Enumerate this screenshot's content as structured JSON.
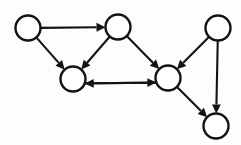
{
  "diagram": {
    "type": "directed-graph",
    "canvas": {
      "width": 241,
      "height": 145,
      "background": "#fdfdfd"
    },
    "style": {
      "node_fill": "#ffffff",
      "node_stroke": "#131313",
      "node_stroke_width": 2.4,
      "node_radius": 12.5,
      "edge_color": "#131313",
      "edge_width": 2.1,
      "arrowhead_length": 9,
      "arrowhead_halfwidth": 4.4
    },
    "node_count": 6,
    "edge_count": 9,
    "nodes": [
      {
        "id": "n1",
        "label": "",
        "name": "node-top-left",
        "cx": 28,
        "cy": 28,
        "r": 12.5
      },
      {
        "id": "n2",
        "label": "",
        "name": "node-top-middle",
        "cx": 118,
        "cy": 27,
        "r": 12.5
      },
      {
        "id": "n3",
        "label": "",
        "name": "node-top-right",
        "cx": 218,
        "cy": 28,
        "r": 12.5
      },
      {
        "id": "n4",
        "label": "",
        "name": "node-left-middle",
        "cx": 73,
        "cy": 79,
        "r": 12.5
      },
      {
        "id": "n5",
        "label": "",
        "name": "node-right-middle",
        "cx": 168,
        "cy": 78,
        "r": 12.5
      },
      {
        "id": "n6",
        "label": "",
        "name": "node-bottom-right",
        "cx": 216,
        "cy": 126,
        "r": 12.5
      }
    ],
    "edges": [
      {
        "id": "e1",
        "name": "edge-top-left-to-top-middle",
        "from": "n1",
        "to": "n2",
        "directed": true,
        "shape": "straight",
        "offset": 0
      },
      {
        "id": "e2",
        "name": "edge-top-left-to-left-middle",
        "from": "n1",
        "to": "n4",
        "directed": true,
        "shape": "straight",
        "offset": 0
      },
      {
        "id": "e3",
        "name": "edge-top-middle-to-left-middle",
        "from": "n2",
        "to": "n4",
        "directed": true,
        "shape": "straight",
        "offset": 0
      },
      {
        "id": "e4",
        "name": "edge-top-middle-to-right-middle",
        "from": "n2",
        "to": "n5",
        "directed": true,
        "shape": "straight",
        "offset": 0
      },
      {
        "id": "e5",
        "name": "edge-top-right-to-right-middle",
        "from": "n3",
        "to": "n5",
        "directed": true,
        "shape": "straight",
        "offset": 0
      },
      {
        "id": "e6",
        "name": "edge-top-right-to-bottom-right",
        "from": "n3",
        "to": "n6",
        "directed": true,
        "shape": "straight",
        "offset": 0
      },
      {
        "id": "e7",
        "name": "edge-right-middle-to-left-middle",
        "from": "n5",
        "to": "n4",
        "directed": true,
        "shape": "straight",
        "offset": -4.5
      },
      {
        "id": "e8",
        "name": "edge-left-middle-to-right-middle",
        "from": "n4",
        "to": "n5",
        "directed": true,
        "shape": "straight",
        "offset": 4.5
      },
      {
        "id": "e9",
        "name": "edge-right-middle-to-bottom-right",
        "from": "n5",
        "to": "n6",
        "directed": true,
        "shape": "straight",
        "offset": 0
      }
    ]
  }
}
